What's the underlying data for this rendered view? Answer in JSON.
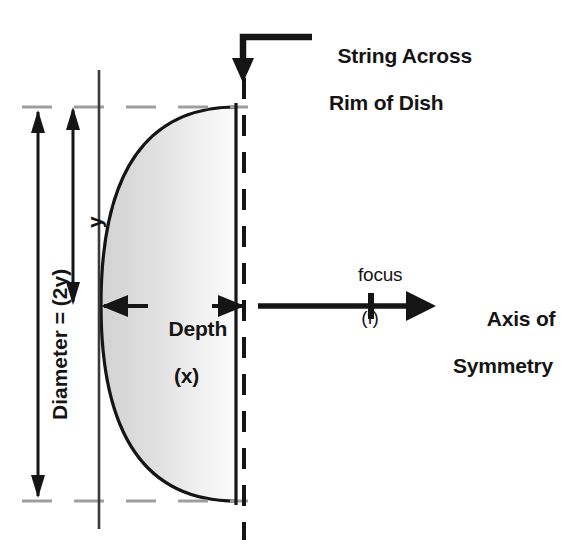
{
  "diagram": {
    "background_color": "#ffffff",
    "stroke_color": "#151515",
    "dash_color": "#9b9b9b",
    "fill_light": "#fbfbfb",
    "fill_dark": "#d6d6d6",
    "labels": {
      "string_across_line1": "String Across",
      "string_across_line2": "Rim of Dish",
      "depth_line1": "Depth",
      "depth_line2": "(x)",
      "focus_line1": "focus",
      "focus_line2": "(f)",
      "axis_line1": "Axis of",
      "axis_line2": "Symmetry",
      "diameter": "Diameter = (2y)",
      "half_height": "y"
    },
    "geometry": {
      "rim_top_y": 107,
      "rim_bottom_y": 501,
      "vertex_x": 101,
      "vertex_y": 305,
      "rim_x": 236,
      "dashed_axis_x": 244,
      "focus_x": 371,
      "axis_arrow_start_x": 258,
      "axis_arrow_end_x": 434,
      "diameter_arrow_x": 38,
      "y_arrow_x": 73,
      "chord_line_x": 99
    }
  }
}
